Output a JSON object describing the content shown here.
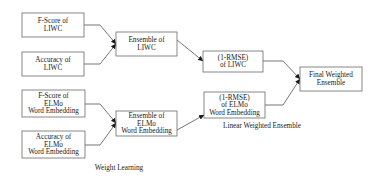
{
  "diagram": {
    "nodes": [
      {
        "id": "fscore_liwc",
        "lines": [
          "F-Score of",
          "LIWC"
        ]
      },
      {
        "id": "acc_liwc",
        "lines": [
          "Accuracy of",
          "LIWC"
        ]
      },
      {
        "id": "ens_liwc",
        "lines": [
          "Ensemble of",
          "LIWC"
        ]
      },
      {
        "id": "rmse_liwc",
        "lines": [
          "(1-RMSE)",
          "of LIWC"
        ]
      },
      {
        "id": "final",
        "lines": [
          "Final Weighted",
          "Ensemble"
        ]
      },
      {
        "id": "fscore_elmo",
        "lines": [
          "F-Score of",
          "ELMo",
          "Word Embedding"
        ]
      },
      {
        "id": "acc_elmo",
        "lines": [
          "Accuracy of",
          "ELMo",
          "Word Embedding"
        ]
      },
      {
        "id": "ens_elmo",
        "lines": [
          "Ensemble of",
          "ELMo",
          "Word Embedding"
        ]
      },
      {
        "id": "rmse_elmo",
        "lines": [
          "(1-RMSE)",
          "of ELMo",
          "Word Embedding"
        ]
      }
    ],
    "edges": [
      {
        "from": "fscore_liwc",
        "to": "ens_liwc"
      },
      {
        "from": "acc_liwc",
        "to": "ens_liwc"
      },
      {
        "from": "ens_liwc",
        "to": "rmse_liwc"
      },
      {
        "from": "rmse_liwc",
        "to": "final"
      },
      {
        "from": "fscore_elmo",
        "to": "ens_elmo"
      },
      {
        "from": "acc_elmo",
        "to": "ens_elmo"
      },
      {
        "from": "ens_elmo",
        "to": "rmse_elmo"
      },
      {
        "from": "rmse_elmo",
        "to": "final"
      }
    ],
    "labels": {
      "linear_weighted_ensemble": "Linear Weighted Ensemble",
      "weight_learning": "Weight Learning"
    }
  }
}
